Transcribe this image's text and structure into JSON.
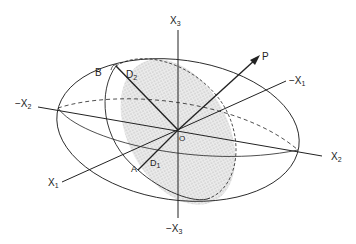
{
  "diagram": {
    "type": "ellipsoid-with-section",
    "colors": {
      "stroke": "#222222",
      "shade": "#d8d8d8",
      "background": "#ffffff"
    },
    "axes": {
      "x3_pos": {
        "base": "X",
        "sub": "3",
        "prefix": ""
      },
      "x3_neg": {
        "base": "X",
        "sub": "3",
        "prefix": "−"
      },
      "x2_pos": {
        "base": "X",
        "sub": "2",
        "prefix": ""
      },
      "x2_neg": {
        "base": "X",
        "sub": "2",
        "prefix": "−"
      },
      "x1_pos": {
        "base": "X",
        "sub": "1",
        "prefix": ""
      },
      "x1_neg": {
        "base": "X",
        "sub": "1",
        "prefix": "−"
      }
    },
    "points": {
      "origin": "O",
      "p": "P",
      "a": "A",
      "b": "B",
      "d1": {
        "base": "D",
        "sub": "1"
      },
      "d2": {
        "base": "D",
        "sub": "2"
      }
    }
  }
}
